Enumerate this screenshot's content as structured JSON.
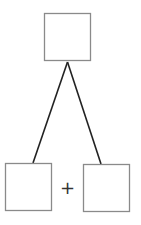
{
  "diagram": {
    "type": "tree",
    "colors": {
      "box_stroke": "#8a8a8a",
      "line_stroke": "#222222",
      "background": "#ffffff"
    },
    "nodes": [
      {
        "id": "top",
        "label": "",
        "x": 44,
        "y": 13,
        "w": 47,
        "h": 48
      },
      {
        "id": "bottom-left",
        "label": "",
        "x": 5,
        "y": 163,
        "w": 47,
        "h": 48
      },
      {
        "id": "bottom-right",
        "label": "",
        "x": 83,
        "y": 164,
        "w": 47,
        "h": 48
      }
    ],
    "edges": [
      {
        "from": "top",
        "to": "bottom-left"
      },
      {
        "from": "top",
        "to": "bottom-right"
      }
    ],
    "operator": "+"
  }
}
